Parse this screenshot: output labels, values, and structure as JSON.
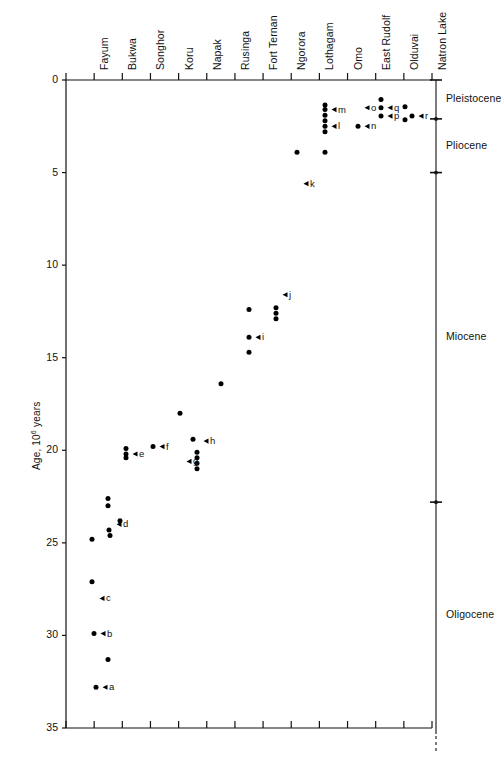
{
  "figure": {
    "y_axis_title": "Age, 10⁶ years",
    "y_ticks": [
      {
        "value": 0,
        "label": "0"
      },
      {
        "value": 5,
        "label": "5"
      },
      {
        "value": 10,
        "label": "10"
      },
      {
        "value": 15,
        "label": "15"
      },
      {
        "value": 20,
        "label": "20"
      },
      {
        "value": 25,
        "label": "25"
      },
      {
        "value": 30,
        "label": "30"
      },
      {
        "value": 35,
        "label": "35"
      }
    ],
    "y_range": [
      0,
      35
    ],
    "axis_color": "#111111",
    "marker_color": "#000000"
  },
  "sites": [
    {
      "id": "fayum",
      "label": "Fayum"
    },
    {
      "id": "bukwa",
      "label": "Bukwa"
    },
    {
      "id": "songhor",
      "label": "Songhor"
    },
    {
      "id": "koru",
      "label": "Koru"
    },
    {
      "id": "napak",
      "label": "Napak"
    },
    {
      "id": "rusinga",
      "label": "Rusinga"
    },
    {
      "id": "fort-ternan",
      "label": "Fort Ternan"
    },
    {
      "id": "ngorora",
      "label": "Ngorora"
    },
    {
      "id": "lothagam",
      "label": "Lothagam"
    },
    {
      "id": "omo",
      "label": "Omo"
    },
    {
      "id": "east-rudolf",
      "label": "East Rudolf"
    },
    {
      "id": "olduvai",
      "label": "Olduvai"
    },
    {
      "id": "natron-lake",
      "label": "Natron Lake"
    }
  ],
  "epochs": [
    {
      "id": "pleistocene",
      "label": "Pleistocene",
      "from": 0.0,
      "to": 2.1
    },
    {
      "id": "pliocene",
      "label": "Pliocene",
      "from": 2.1,
      "to": 5.0
    },
    {
      "id": "miocene",
      "label": "Miocene",
      "from": 5.0,
      "to": 22.8
    },
    {
      "id": "oligocene",
      "label": "Oligocene",
      "from": 22.8,
      "to": 35.0
    }
  ],
  "chart_data": {
    "type": "scatter",
    "title": "",
    "xlabel": "",
    "ylabel": "Age, 10⁶ years",
    "ylim": [
      0,
      35
    ],
    "y_inverted": true,
    "grid": false,
    "legend": "none",
    "x_categories": [
      "Fayum",
      "Bukwa",
      "Songhor",
      "Koru",
      "Napak",
      "Rusinga",
      "Fort Ternan",
      "Ngorora",
      "Lothagam",
      "Omo",
      "East Rudolf",
      "Olduvai",
      "Natron Lake"
    ],
    "points": [
      {
        "x_px": 92,
        "age": 24.8
      },
      {
        "x_px": 92,
        "age": 27.1
      },
      {
        "x_px": 94,
        "age": 29.9
      },
      {
        "x_px": 96,
        "age": 32.8
      },
      {
        "x_px": 108,
        "age": 31.3
      },
      {
        "x_px": 108,
        "age": 23.0
      },
      {
        "x_px": 108,
        "age": 22.6
      },
      {
        "x_px": 109,
        "age": 24.3
      },
      {
        "x_px": 110,
        "age": 24.6
      },
      {
        "x_px": 120,
        "age": 23.8
      },
      {
        "x_px": 126,
        "age": 20.2
      },
      {
        "x_px": 126,
        "age": 19.9
      },
      {
        "x_px": 126,
        "age": 20.4
      },
      {
        "x_px": 153,
        "age": 19.8
      },
      {
        "x_px": 180,
        "age": 18.0
      },
      {
        "x_px": 193,
        "age": 19.4
      },
      {
        "x_px": 197,
        "age": 20.1
      },
      {
        "x_px": 197,
        "age": 20.4
      },
      {
        "x_px": 197,
        "age": 20.7
      },
      {
        "x_px": 197,
        "age": 21.0
      },
      {
        "x_px": 221,
        "age": 16.4
      },
      {
        "x_px": 249,
        "age": 14.7
      },
      {
        "x_px": 249,
        "age": 13.9
      },
      {
        "x_px": 249,
        "age": 12.4
      },
      {
        "x_px": 276,
        "age": 12.3
      },
      {
        "x_px": 276,
        "age": 12.6
      },
      {
        "x_px": 276,
        "age": 12.9
      },
      {
        "x_px": 297,
        "age": 3.9
      },
      {
        "x_px": 325,
        "age": 3.9
      },
      {
        "x_px": 325,
        "age": 2.8
      },
      {
        "x_px": 325,
        "age": 2.5
      },
      {
        "x_px": 325,
        "age": 2.2
      },
      {
        "x_px": 325,
        "age": 1.9
      },
      {
        "x_px": 325,
        "age": 1.6
      },
      {
        "x_px": 325,
        "age": 1.35
      },
      {
        "x_px": 358,
        "age": 2.5
      },
      {
        "x_px": 381,
        "age": 1.05
      },
      {
        "x_px": 381,
        "age": 1.5
      },
      {
        "x_px": 381,
        "age": 1.95
      },
      {
        "x_px": 405,
        "age": 1.45
      },
      {
        "x_px": 405,
        "age": 2.15
      },
      {
        "x_px": 412,
        "age": 1.95
      }
    ],
    "annotations": [
      {
        "key": "a",
        "label": "a",
        "x_px": 96,
        "age": 32.8
      },
      {
        "key": "b",
        "label": "b",
        "x_px": 94,
        "age": 29.9
      },
      {
        "key": "c",
        "label": "c",
        "x_px": 93,
        "age": 28.0
      },
      {
        "key": "d",
        "label": "d",
        "x_px": 110,
        "age": 24.0
      },
      {
        "key": "e",
        "label": "e",
        "x_px": 126,
        "age": 20.2
      },
      {
        "key": "f",
        "label": "f",
        "x_px": 153,
        "age": 19.8
      },
      {
        "key": "g",
        "label": "g",
        "x_px": 180,
        "age": 20.6
      },
      {
        "key": "h",
        "label": "h",
        "x_px": 197,
        "age": 19.5
      },
      {
        "key": "i",
        "label": "i",
        "x_px": 249,
        "age": 13.9
      },
      {
        "key": "j",
        "label": "j",
        "x_px": 276,
        "age": 11.6
      },
      {
        "key": "k",
        "label": "k",
        "x_px": 297,
        "age": 5.6
      },
      {
        "key": "l",
        "label": "l",
        "x_px": 325,
        "age": 2.5
      },
      {
        "key": "m",
        "label": "m",
        "x_px": 325,
        "age": 1.6
      },
      {
        "key": "n",
        "label": "n",
        "x_px": 358,
        "age": 2.5
      },
      {
        "key": "o",
        "label": "o",
        "x_px": 358,
        "age": 1.5
      },
      {
        "key": "p",
        "label": "p",
        "x_px": 381,
        "age": 1.95
      },
      {
        "key": "q",
        "label": "q",
        "x_px": 381,
        "age": 1.5
      },
      {
        "key": "r",
        "label": "r",
        "x_px": 412,
        "age": 1.95
      }
    ]
  }
}
